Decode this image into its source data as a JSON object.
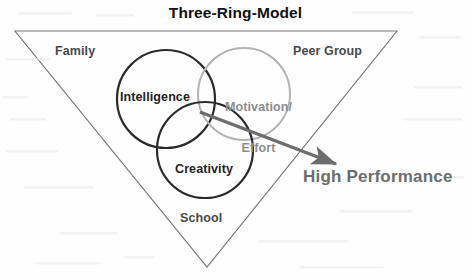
{
  "diagram": {
    "title": "Three-Ring-Model",
    "type": "venn-three-circle-in-triangle",
    "background_color": "#fefefe",
    "triangle": {
      "name": "context-triangle",
      "stroke_color": "#777777",
      "vertices": [
        [
          15,
          31
        ],
        [
          397,
          31
        ],
        [
          207,
          267
        ]
      ],
      "corner_labels": [
        {
          "id": "family",
          "text": "Family",
          "x": 55,
          "y": 45,
          "color": "#4a4a4a"
        },
        {
          "id": "peer-group",
          "text": "Peer Group",
          "x": 293,
          "y": 45,
          "color": "#4a4a4a"
        },
        {
          "id": "school",
          "text": "School",
          "x": 180,
          "y": 212,
          "color": "#4a4a4a"
        }
      ]
    },
    "rings": [
      {
        "id": "intelligence",
        "label": "Intelligence",
        "cx": 166,
        "cy": 99,
        "r": 49,
        "stroke_color": "#2b2b2b",
        "stroke_width": 2.2,
        "label_color": "#242424",
        "label_x": 120,
        "label_y": 91
      },
      {
        "id": "motivation-effort",
        "label": "Motivation/\nEffort",
        "label_line1": "Motivation/",
        "label_line2": "Effort",
        "cx": 244,
        "cy": 94,
        "r": 46,
        "stroke_color": "#b4b4b4",
        "stroke_width": 2.0,
        "label_color": "#8e8e8e",
        "label_x": 225,
        "label_y": 74
      },
      {
        "id": "creativity",
        "label": "Creativity",
        "cx": 205,
        "cy": 150,
        "r": 48,
        "stroke_color": "#2b2b2b",
        "stroke_width": 2.2,
        "label_color": "#242424",
        "label_x": 175,
        "label_y": 163
      }
    ],
    "arrow": {
      "id": "high-performance-arrow",
      "from": [
        200,
        112
      ],
      "to": [
        340,
        166
      ],
      "color": "#6d6d6d",
      "width": 3.4
    },
    "outcome_label": {
      "id": "high-performance",
      "text": "High Performance",
      "x": 303,
      "y": 168,
      "color": "#6d6d6d"
    }
  }
}
